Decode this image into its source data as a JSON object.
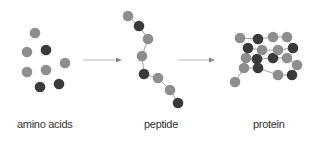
{
  "colors": {
    "light": "#8e8e8e",
    "dark": "#3a3a3a",
    "line": "#a0a0a0",
    "arrow": "#b8b8b8",
    "background": "#ffffff"
  },
  "labels": {
    "amino_acids": "amino acids",
    "peptide": "peptide",
    "protein": "protein"
  },
  "stages": [
    {
      "name": "amino acids",
      "residues": [
        {
          "x": 35,
          "y": 33,
          "c": "light"
        },
        {
          "x": 27,
          "y": 52,
          "c": "light"
        },
        {
          "x": 46,
          "y": 50,
          "c": "dark"
        },
        {
          "x": 65,
          "y": 63,
          "c": "light"
        },
        {
          "x": 27,
          "y": 72,
          "c": "light"
        },
        {
          "x": 46,
          "y": 70,
          "c": "light"
        },
        {
          "x": 40,
          "y": 87,
          "c": "dark"
        },
        {
          "x": 59,
          "y": 84,
          "c": "dark"
        }
      ]
    },
    {
      "name": "peptide",
      "residues": [
        {
          "x": 128,
          "y": 16,
          "c": "light"
        },
        {
          "x": 139,
          "y": 26,
          "c": "dark"
        },
        {
          "x": 148,
          "y": 39,
          "c": "light"
        },
        {
          "x": 142,
          "y": 56,
          "c": "light"
        },
        {
          "x": 144,
          "y": 74,
          "c": "dark"
        },
        {
          "x": 158,
          "y": 78,
          "c": "light"
        },
        {
          "x": 170,
          "y": 90,
          "c": "light"
        },
        {
          "x": 178,
          "y": 103,
          "c": "dark"
        }
      ]
    },
    {
      "name": "protein",
      "residues": [
        {
          "x": 235,
          "y": 82,
          "c": "light"
        },
        {
          "x": 244,
          "y": 68,
          "c": "light"
        },
        {
          "x": 258,
          "y": 68,
          "c": "dark"
        },
        {
          "x": 278,
          "y": 75,
          "c": "light"
        },
        {
          "x": 292,
          "y": 75,
          "c": "dark"
        },
        {
          "x": 297,
          "y": 65,
          "c": "light"
        },
        {
          "x": 287,
          "y": 58,
          "c": "light"
        },
        {
          "x": 273,
          "y": 58,
          "c": "dark"
        },
        {
          "x": 257,
          "y": 59,
          "c": "dark"
        },
        {
          "x": 246,
          "y": 58,
          "c": "light"
        },
        {
          "x": 248,
          "y": 48,
          "c": "dark"
        },
        {
          "x": 262,
          "y": 50,
          "c": "light"
        },
        {
          "x": 278,
          "y": 50,
          "c": "light"
        },
        {
          "x": 293,
          "y": 48,
          "c": "dark"
        },
        {
          "x": 287,
          "y": 37,
          "c": "light"
        },
        {
          "x": 273,
          "y": 37,
          "c": "light"
        },
        {
          "x": 258,
          "y": 39,
          "c": "dark"
        },
        {
          "x": 240,
          "y": 38,
          "c": "light"
        }
      ]
    }
  ],
  "arrows": [
    {
      "x1": 83,
      "y1": 60,
      "x2": 122,
      "y2": 60
    },
    {
      "x1": 178,
      "y1": 60,
      "x2": 215,
      "y2": 60
    }
  ]
}
